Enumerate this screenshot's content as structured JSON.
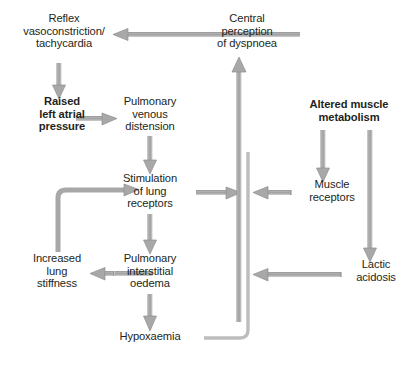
{
  "diagram": {
    "background_color": "#ffffff",
    "text_color": "#231f20",
    "arrow_color": "#a6a6a6",
    "arrow_edge_color": "#7f7f7f",
    "nodes": {
      "reflex": {
        "label": "Reflex\nvasoconstriction/\ntachycardia",
        "bold": false
      },
      "raised_left_atrial": {
        "label": "Raised\nleft atrial\npressure",
        "bold": true
      },
      "pulmonary_venous": {
        "label": "Pulmonary\nvenous\ndistension",
        "bold": false
      },
      "stimulation_lung": {
        "label": "Stimulation\nof lung\nreceptors",
        "bold": false
      },
      "pulmonary_interstitial": {
        "label": "Pulmonary\ninterstitial\noedema",
        "bold": false
      },
      "increased_lung_stiffness": {
        "label": "Increased\nlung\nstiffness",
        "bold": false
      },
      "hypoxaemia": {
        "label": "Hypoxaemia",
        "bold": false
      },
      "central_perception": {
        "label": "Central\nperception\nof dyspnoea",
        "bold": false
      },
      "altered_muscle": {
        "label": "Altered muscle\nmetabolism",
        "bold": true
      },
      "muscle_receptors": {
        "label": "Muscle\nreceptors",
        "bold": false
      },
      "lactic_acidosis": {
        "label": "Lactic\nacidosis",
        "bold": false
      }
    },
    "edges": [
      {
        "name": "central-to-reflex",
        "from": "central_perception",
        "to": "reflex",
        "direction": "left"
      },
      {
        "name": "reflex-to-raised",
        "from": "reflex",
        "to": "raised_left_atrial",
        "direction": "down"
      },
      {
        "name": "raised-to-pulmonary-venous",
        "from": "raised_left_atrial",
        "to": "pulmonary_venous",
        "direction": "right"
      },
      {
        "name": "pulmonary-venous-to-stimulation",
        "from": "pulmonary_venous",
        "to": "stimulation_lung",
        "direction": "down"
      },
      {
        "name": "stimulation-to-interstitial",
        "from": "stimulation_lung",
        "to": "pulmonary_interstitial",
        "direction": "down"
      },
      {
        "name": "interstitial-to-stiffness",
        "from": "pulmonary_interstitial",
        "to": "increased_lung_stiffness",
        "direction": "left"
      },
      {
        "name": "stiffness-to-stimulation",
        "from": "increased_lung_stiffness",
        "to": "stimulation_lung",
        "direction": "up-right"
      },
      {
        "name": "interstitial-to-hypoxaemia",
        "from": "pulmonary_interstitial",
        "to": "hypoxaemia",
        "direction": "down"
      },
      {
        "name": "stimulation-to-central-trunk",
        "from": "stimulation_lung",
        "to": "central_perception",
        "direction": "right-then-up"
      },
      {
        "name": "hypoxaemia-to-central-trunk",
        "from": "hypoxaemia",
        "to": "central_perception",
        "direction": "right-then-up"
      },
      {
        "name": "altered-to-muscle-receptors",
        "from": "altered_muscle",
        "to": "muscle_receptors",
        "direction": "down"
      },
      {
        "name": "altered-to-lactic",
        "from": "altered_muscle",
        "to": "lactic_acidosis",
        "direction": "down"
      },
      {
        "name": "muscle-receptors-to-trunk",
        "from": "muscle_receptors",
        "to": "central_perception",
        "direction": "left"
      },
      {
        "name": "lactic-to-trunk",
        "from": "lactic_acidosis",
        "to": "central_perception",
        "direction": "left"
      },
      {
        "name": "trunk-to-central",
        "from": "trunk",
        "to": "central_perception",
        "direction": "up"
      }
    ]
  }
}
